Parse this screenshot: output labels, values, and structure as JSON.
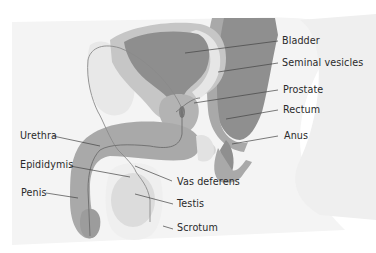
{
  "diagram": {
    "title": "",
    "colors": {
      "background": "#ffffff",
      "body_bg": "#f3f3f3",
      "dark_organ": "#8e8e8e",
      "mid_organ": "#a9a9a9",
      "light_organ": "#cdcdcd",
      "pale_organ": "#e3e3e3",
      "leader_line": "#444444",
      "label_text": "#2a2a2a"
    },
    "labels": [
      {
        "id": "bladder",
        "text": "Bladder"
      },
      {
        "id": "seminal-vesicles",
        "text": "Seminal vesicles"
      },
      {
        "id": "prostate",
        "text": "Prostate"
      },
      {
        "id": "rectum",
        "text": "Rectum"
      },
      {
        "id": "anus",
        "text": "Anus"
      },
      {
        "id": "urethra",
        "text": "Urethra"
      },
      {
        "id": "epididymis",
        "text": "Epididymis"
      },
      {
        "id": "vas-deferens",
        "text": "Vas deferens"
      },
      {
        "id": "penis",
        "text": "Penis"
      },
      {
        "id": "testis",
        "text": "Testis"
      },
      {
        "id": "scrotum",
        "text": "Scrotum"
      }
    ]
  }
}
